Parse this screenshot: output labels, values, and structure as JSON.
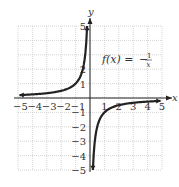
{
  "chart_data": {
    "type": "line",
    "title": "",
    "function_label": "f(x) = -1/x",
    "function_label_parts": {
      "lhs": "f(x) =",
      "sign": "−",
      "numerator": "1",
      "denominator": "x"
    },
    "xlabel": "x",
    "ylabel": "y",
    "xlim": [
      -5,
      5
    ],
    "ylim": [
      -5,
      5
    ],
    "grid": true,
    "x_ticks": [
      "−5",
      "−4",
      "−3",
      "−2",
      "−1",
      "1",
      "2",
      "3",
      "4",
      "5"
    ],
    "y_ticks": [
      "5",
      "2",
      "1",
      "−1",
      "−2",
      "−3",
      "−4",
      "−5"
    ],
    "series": [
      {
        "name": "left branch (x<0)",
        "x": [
          -5,
          -4,
          -3,
          -2,
          -1,
          -0.5,
          -0.333,
          -0.25,
          -0.2
        ],
        "y": [
          0.2,
          0.25,
          0.333,
          0.5,
          1,
          2,
          3,
          4,
          5
        ]
      },
      {
        "name": "right branch (x>0)",
        "x": [
          0.2,
          0.25,
          0.333,
          0.5,
          1,
          2,
          3,
          4,
          5
        ],
        "y": [
          -5,
          -4,
          -3,
          -2,
          -1,
          -0.5,
          -0.333,
          -0.25,
          -0.2
        ]
      }
    ],
    "asymptotes": {
      "vertical": 0,
      "horizontal": 0
    }
  }
}
